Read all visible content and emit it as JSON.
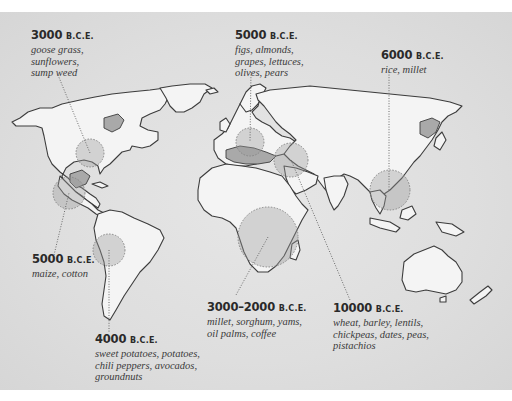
{
  "map": {
    "title": "Origins of plant domestication",
    "colors": {
      "background": "#ffffff",
      "panel": "#dedede",
      "land": "#f4f4f4",
      "coastline": "#3c3c3c",
      "origin_circle": "#9c9c9c"
    }
  },
  "labels": [
    {
      "id": "north-america",
      "year": "3000",
      "era": "B.C.E.",
      "crops": "goose grass,\nsunflowers,\nsump weed"
    },
    {
      "id": "mediterranean",
      "year": "5000",
      "era": "B.C.E.",
      "crops": "figs, almonds,\ngrapes, lettuces,\nolives, pears"
    },
    {
      "id": "east-asia",
      "year": "6000",
      "era": "B.C.E.",
      "crops": "rice, millet"
    },
    {
      "id": "mesoamerica",
      "year": "5000",
      "era": "B.C.E.",
      "crops": "maize, cotton"
    },
    {
      "id": "andes",
      "year": "4000",
      "era": "B.C.E.",
      "crops": "sweet potatoes, potatoes,\nchili peppers, avocados,\ngroundnuts"
    },
    {
      "id": "sub-saharan-africa",
      "year": "3000–2000",
      "era": "B.C.E.",
      "crops": "millet, sorghum, yams,\noil palms, coffee"
    },
    {
      "id": "fertile-crescent",
      "year": "10000",
      "era": "B.C.E.",
      "crops": "wheat, barley, lentils,\nchickpeas, dates, peas,\npistachios"
    }
  ]
}
